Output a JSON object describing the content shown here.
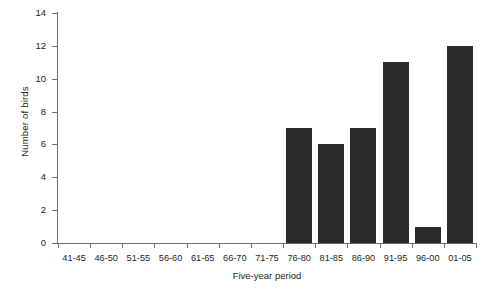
{
  "chart_data": {
    "type": "bar",
    "title": "",
    "xlabel": "Five-year period",
    "ylabel": "Number of birds",
    "categories": [
      "41-45",
      "46-50",
      "51-55",
      "56-60",
      "61-65",
      "66-70",
      "71-75",
      "76-80",
      "81-85",
      "86-90",
      "91-95",
      "96-00",
      "01-05"
    ],
    "values": [
      0,
      0,
      0,
      0,
      0,
      0,
      0,
      7,
      6,
      7,
      11,
      1,
      12
    ],
    "ylim": [
      0,
      14
    ],
    "ytick_labels": [
      "0",
      "2",
      "4",
      "6",
      "8",
      "10",
      "12",
      "14"
    ],
    "ytick_values": [
      0,
      2,
      4,
      6,
      8,
      10,
      12,
      14
    ],
    "grid": false,
    "legend": null,
    "bar_color": "#2b2b2b",
    "axis_color": "#6d6e71",
    "text_color": "#231f20"
  }
}
